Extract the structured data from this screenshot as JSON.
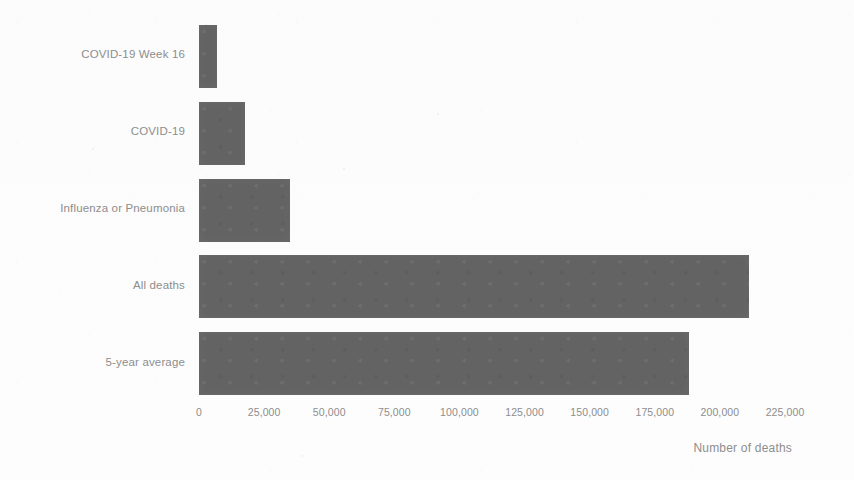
{
  "chart_data": {
    "type": "bar",
    "orientation": "horizontal",
    "title": "",
    "subtitle": "",
    "xlabel": "Number of deaths",
    "ylabel": "",
    "categories": [
      "COVID-19 Week 16",
      "COVID-19",
      "Influenza or Pneumonia",
      "All deaths",
      "5-year average"
    ],
    "values": [
      7000,
      17700,
      34900,
      211000,
      188000
    ],
    "xlim": [
      0,
      225000
    ],
    "xticks": [
      0,
      25000,
      50000,
      75000,
      100000,
      125000,
      150000,
      175000,
      200000,
      225000
    ],
    "xtick_labels": [
      "0",
      "25,000",
      "50,000",
      "75,000",
      "100,000",
      "125,000",
      "150,000",
      "175,000",
      "200,000",
      "225,000"
    ],
    "grid": false,
    "legend": null,
    "bar_color": "#636363",
    "text_color": "#8d8d8d",
    "background_color": "#fdfdfd"
  }
}
